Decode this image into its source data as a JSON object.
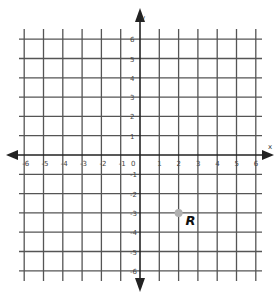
{
  "chart_data": {
    "type": "scatter",
    "title": "",
    "xlabel": "x",
    "ylabel": "y",
    "xlim": [
      -6,
      6
    ],
    "ylim": [
      -6,
      6
    ],
    "grid": true,
    "x_ticks": [
      "-6",
      "-5",
      "-4",
      "-3",
      "-2",
      "-1",
      "0",
      "1",
      "2",
      "3",
      "4",
      "5",
      "6"
    ],
    "y_ticks": [
      "6",
      "5",
      "4",
      "3",
      "2",
      "1",
      "-1",
      "-2",
      "-3",
      "-4",
      "-5",
      "-6"
    ],
    "points": [
      {
        "label": "R",
        "x": 2,
        "y": -3,
        "color": "#b0b0b0"
      }
    ]
  },
  "axes": {
    "x_label": "x",
    "y_label": "y",
    "origin_label": "0"
  },
  "point": {
    "label": "R"
  }
}
